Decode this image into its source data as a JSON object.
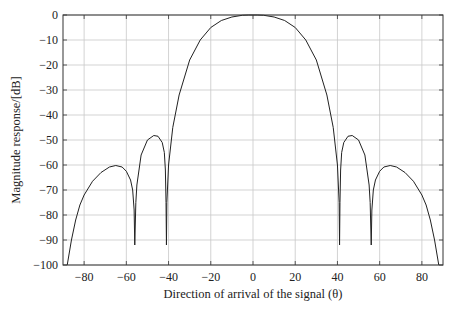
{
  "chart_data": {
    "type": "line",
    "title": "",
    "xlabel": "Direction of arrival of the signal (θ)",
    "ylabel": "Magnitude response/[dB]",
    "xlim": [
      -90,
      90
    ],
    "ylim": [
      -100,
      0
    ],
    "xticks": [
      -80,
      -60,
      -40,
      -20,
      0,
      20,
      40,
      60,
      80
    ],
    "yticks": [
      0,
      -10,
      -20,
      -30,
      -40,
      -50,
      -60,
      -70,
      -80,
      -90,
      -100
    ],
    "xtick_labels": [
      "−80",
      "−60",
      "−40",
      "−20",
      "0",
      "20",
      "40",
      "60",
      "80"
    ],
    "ytick_labels": [
      "0",
      "−10",
      "−20",
      "−30",
      "−40",
      "−50",
      "−60",
      "−70",
      "−80",
      "−90",
      "−100"
    ],
    "grid": true,
    "legend": null,
    "series": [
      {
        "name": "Magnitude response",
        "color": "#222222",
        "x": [
          -88,
          -86,
          -84,
          -82,
          -80,
          -76,
          -72,
          -68,
          -65,
          -62,
          -60,
          -58,
          -57,
          -56.3,
          -56,
          -55.5,
          -55,
          -53,
          -50,
          -47,
          -45,
          -43,
          -42,
          -41.5,
          -41.2,
          -41,
          -40.8,
          -40,
          -38,
          -35,
          -30,
          -25,
          -20,
          -15,
          -10,
          -5,
          -2,
          0,
          2,
          5,
          10,
          15,
          20,
          25,
          30,
          35,
          38,
          40,
          40.8,
          41,
          41.2,
          41.5,
          42,
          43,
          45,
          47,
          50,
          53,
          55,
          55.5,
          56,
          56.3,
          57,
          58,
          60,
          62,
          65,
          68,
          72,
          76,
          80,
          82,
          84,
          86,
          88
        ],
        "y": [
          -100,
          -90,
          -82,
          -76,
          -72,
          -66.5,
          -63,
          -60.8,
          -60.2,
          -60.8,
          -62.5,
          -66,
          -70,
          -78,
          -92,
          -75,
          -68,
          -56,
          -50,
          -48.2,
          -48.5,
          -51,
          -55,
          -62,
          -75,
          -92,
          -75,
          -60,
          -45,
          -32,
          -18,
          -10,
          -5,
          -2.2,
          -0.8,
          -0.1,
          0,
          0,
          0,
          -0.1,
          -0.8,
          -2.2,
          -5,
          -10,
          -18,
          -32,
          -45,
          -60,
          -75,
          -92,
          -75,
          -62,
          -55,
          -51,
          -48.5,
          -48.2,
          -50,
          -56,
          -68,
          -75,
          -92,
          -78,
          -70,
          -66,
          -62.5,
          -60.8,
          -60.2,
          -60.8,
          -63,
          -66.5,
          -72,
          -76,
          -82,
          -90,
          -100
        ],
        "annotations": {
          "main_lobe_peak": {
            "x": 0,
            "y": 0
          },
          "nulls_deg": [
            -56,
            -41,
            41,
            56
          ],
          "null_depth_db": -92,
          "first_sidelobes": [
            {
              "x": -46,
              "y": -48
            },
            {
              "x": 46,
              "y": -48
            }
          ],
          "second_sidelobes": [
            {
              "x": -65,
              "y": -60
            },
            {
              "x": 65,
              "y": -60
            }
          ]
        }
      }
    ]
  },
  "layout": {
    "plot_left": 63,
    "plot_right": 443,
    "plot_top": 15,
    "plot_bottom": 265,
    "frame_color": "#333333",
    "grid_color": "#c8c8c8",
    "line_color": "#222222"
  }
}
